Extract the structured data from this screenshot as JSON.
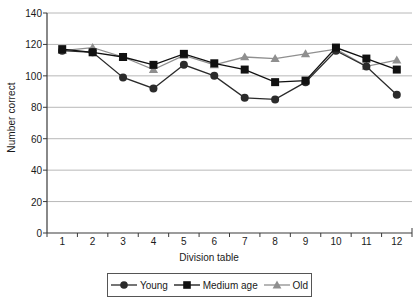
{
  "chart_data": {
    "type": "line",
    "title": "",
    "xlabel": "Division table",
    "ylabel": "Number correct",
    "categories": [
      "1",
      "2",
      "3",
      "4",
      "5",
      "6",
      "7",
      "8",
      "9",
      "10",
      "11",
      "12"
    ],
    "ylim": [
      0,
      140
    ],
    "ytick_step": 20,
    "yticks": [
      "0",
      "20",
      "40",
      "60",
      "80",
      "100",
      "120",
      "140"
    ],
    "grid": true,
    "grid_axis": "y",
    "legend_position": "bottom",
    "series": [
      {
        "name": "Young",
        "marker": "circle",
        "color": "#2b2b2b",
        "values": [
          116,
          115,
          99,
          92,
          107,
          100,
          86,
          85,
          96,
          116,
          106,
          88
        ]
      },
      {
        "name": "Medium age",
        "marker": "square",
        "color": "#111111",
        "values": [
          117,
          115,
          112,
          107,
          114,
          108,
          104,
          96,
          97,
          118,
          111,
          104
        ]
      },
      {
        "name": "Old",
        "marker": "triangle",
        "color": "#8f8f8f",
        "values": [
          116,
          118,
          112,
          104,
          113,
          107,
          112,
          111,
          114,
          117,
          106,
          110
        ]
      }
    ]
  },
  "axis": {
    "y_title": "Number correct",
    "x_title": "Division table"
  },
  "legend": {
    "items": [
      {
        "label": "Young"
      },
      {
        "label": "Medium age"
      },
      {
        "label": "Old"
      }
    ]
  },
  "colors": {
    "axis": "#3a3a3a",
    "grid": "#b8b8b8",
    "background": "#ffffff",
    "young": "#2b2b2b",
    "medium": "#111111",
    "old": "#8f8f8f"
  }
}
